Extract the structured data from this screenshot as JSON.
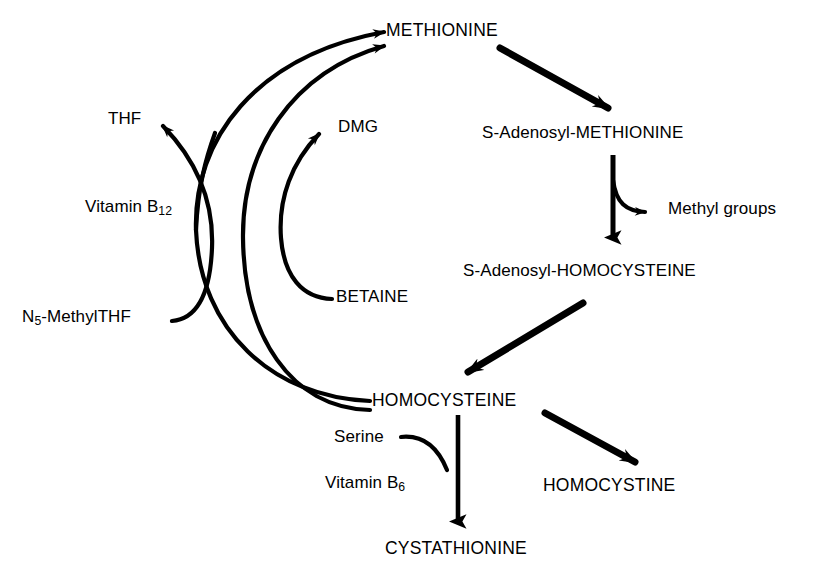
{
  "diagram": {
    "ink_color": "#000000",
    "background_color": "#ffffff",
    "nodes": {
      "methionine": "METHIONINE",
      "sam": "S-Adenosyl-METHIONINE",
      "methyl_groups": "Methyl groups",
      "sah": "S-Adenosyl-HOMOCYSTEINE",
      "homocysteine": "HOMOCYSTEINE",
      "homocystine": "HOMOCYSTINE",
      "cystathionine": "CYSTATHIONINE",
      "thf": "THF",
      "dmg": "DMG",
      "betaine": "BETAINE",
      "serine": "Serine"
    },
    "cofactors": {
      "vitamin_b12_name": "Vitamin B",
      "vitamin_b12_sub": "12",
      "vitamin_b6_name": "Vitamin B",
      "vitamin_b6_sub": "6",
      "n5_methyl_thf_prefix": "N",
      "n5_methyl_thf_sub": "5",
      "n5_methyl_thf_suffix": "-MethylTHF"
    },
    "edges": [
      {
        "name": "methionine-to-sam",
        "from": "METHIONINE",
        "to": "S-Adenosyl-METHIONINE",
        "style": "thick-straight"
      },
      {
        "name": "sam-to-sah",
        "from": "S-Adenosyl-METHIONINE",
        "to": "S-Adenosyl-HOMOCYSTEINE",
        "style": "vertical"
      },
      {
        "name": "sam-to-methyl-groups",
        "from": "S-Adenosyl-METHIONINE",
        "to": "Methyl groups",
        "style": "branch"
      },
      {
        "name": "sah-to-homocysteine",
        "from": "S-Adenosyl-HOMOCYSTEINE",
        "to": "HOMOCYSTEINE",
        "style": "thick-straight"
      },
      {
        "name": "homocysteine-to-homocystine",
        "from": "HOMOCYSTEINE",
        "to": "HOMOCYSTINE",
        "style": "thick-straight"
      },
      {
        "name": "homocysteine-to-cystathionine",
        "from": "HOMOCYSTEINE",
        "to": "CYSTATHIONINE",
        "style": "vertical"
      },
      {
        "name": "serine-to-cystathionine",
        "from": "Serine",
        "to": "CYSTATHIONINE",
        "style": "branch-in"
      },
      {
        "name": "homocysteine-to-methionine-b12",
        "from": "HOMOCYSTEINE",
        "to": "METHIONINE",
        "style": "curve"
      },
      {
        "name": "homocysteine-to-methionine-betaine",
        "from": "HOMOCYSTEINE",
        "to": "METHIONINE",
        "style": "curve"
      },
      {
        "name": "n5-methylthf-to-thf",
        "from": "N5-MethylTHF",
        "to": "THF",
        "style": "crossing-curve"
      },
      {
        "name": "betaine-to-dmg",
        "from": "BETAINE",
        "to": "DMG",
        "style": "crossing-curve"
      }
    ]
  }
}
